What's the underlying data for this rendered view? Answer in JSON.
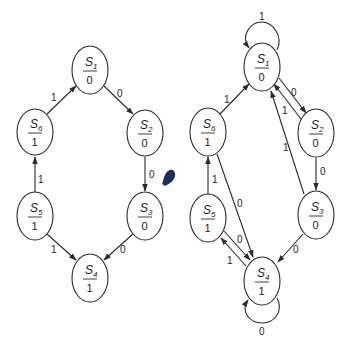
{
  "diagrams": [
    {
      "id": "left",
      "title": "Ring state machine",
      "states": [
        {
          "id": "S1",
          "name": "S",
          "sub": "1",
          "output": "0",
          "cx": 90,
          "cy": 70
        },
        {
          "id": "S2",
          "name": "S",
          "sub": "2",
          "output": "0",
          "cx": 145,
          "cy": 133
        },
        {
          "id": "S3",
          "name": "S",
          "sub": "3",
          "output": "0",
          "cx": 145,
          "cy": 216
        },
        {
          "id": "S4",
          "name": "S",
          "sub": "4",
          "output": "1",
          "cx": 90,
          "cy": 278
        },
        {
          "id": "S5",
          "name": "S",
          "sub": "5",
          "output": "1",
          "cx": 35,
          "cy": 216
        },
        {
          "id": "S6",
          "name": "S",
          "sub": "6",
          "output": "1",
          "cx": 35,
          "cy": 132
        }
      ],
      "transitions": [
        {
          "from": "S1",
          "to": "S2",
          "label": "0"
        },
        {
          "from": "S2",
          "to": "S3",
          "label": "0"
        },
        {
          "from": "S3",
          "to": "S4",
          "label": "0"
        },
        {
          "from": "S5",
          "to": "S4",
          "label": "1"
        },
        {
          "from": "S5",
          "to": "S6",
          "label": "1"
        },
        {
          "from": "S6",
          "to": "S1",
          "label": "1"
        }
      ]
    },
    {
      "id": "right",
      "title": "Complete state machine",
      "states": [
        {
          "id": "S1",
          "name": "S",
          "sub": "1",
          "output": "0",
          "cx": 262,
          "cy": 67
        },
        {
          "id": "S2",
          "name": "S",
          "sub": "2",
          "output": "0",
          "cx": 316,
          "cy": 133
        },
        {
          "id": "S3",
          "name": "S",
          "sub": "3",
          "output": "0",
          "cx": 316,
          "cy": 215
        },
        {
          "id": "S4",
          "name": "S",
          "sub": "4",
          "output": "1",
          "cx": 262,
          "cy": 281
        },
        {
          "id": "S5",
          "name": "S",
          "sub": "5",
          "output": "1",
          "cx": 208,
          "cy": 218
        },
        {
          "id": "S6",
          "name": "S",
          "sub": "6",
          "output": "1",
          "cx": 208,
          "cy": 132
        }
      ],
      "transitions": [
        {
          "from": "S1",
          "to": "S1",
          "label": "1"
        },
        {
          "from": "S1",
          "to": "S2",
          "label": "0"
        },
        {
          "from": "S2",
          "to": "S1",
          "label": "1"
        },
        {
          "from": "S2",
          "to": "S3",
          "label": "0"
        },
        {
          "from": "S3",
          "to": "S1",
          "label": "1"
        },
        {
          "from": "S3",
          "to": "S4",
          "label": "0"
        },
        {
          "from": "S4",
          "to": "S4",
          "label": "0"
        },
        {
          "from": "S4",
          "to": "S5",
          "label": "1"
        },
        {
          "from": "S5",
          "to": "S4",
          "label": "0"
        },
        {
          "from": "S5",
          "to": "S6",
          "label": "1"
        },
        {
          "from": "S6",
          "to": "S1",
          "label": "1"
        },
        {
          "from": "S6",
          "to": "S4",
          "label": "0"
        }
      ]
    }
  ],
  "labels": {
    "L_S1": {
      "name": "S",
      "sub": "1",
      "out": "0"
    },
    "L_S2": {
      "name": "S",
      "sub": "2",
      "out": "0"
    },
    "L_S3": {
      "name": "S",
      "sub": "3",
      "out": "0"
    },
    "L_S4": {
      "name": "S",
      "sub": "4",
      "out": "1"
    },
    "L_S5": {
      "name": "S",
      "sub": "5",
      "out": "1"
    },
    "L_S6": {
      "name": "S",
      "sub": "6",
      "out": "1"
    },
    "R_S1": {
      "name": "S",
      "sub": "1",
      "out": "0"
    },
    "R_S2": {
      "name": "S",
      "sub": "2",
      "out": "0"
    },
    "R_S3": {
      "name": "S",
      "sub": "3",
      "out": "0"
    },
    "R_S4": {
      "name": "S",
      "sub": "4",
      "out": "1"
    },
    "R_S5": {
      "name": "S",
      "sub": "5",
      "out": "1"
    },
    "R_S6": {
      "name": "S",
      "sub": "6",
      "out": "1"
    }
  },
  "edge_labels": {
    "left": {
      "s1_s2": "0",
      "s2_s3": "0",
      "s3_s4": "0",
      "s5_s4": "1",
      "s5_s6": "1",
      "s6_s1": "1"
    },
    "right": {
      "s1_self": "1",
      "s1_s2": "0",
      "s2_s1": "1",
      "s2_s3": "0",
      "s3_s1": "1",
      "s3_s4": "0",
      "s4_self": "0",
      "s4_s5": "1",
      "s5_s4": "0",
      "s5_s6": "1",
      "s6_s1": "1",
      "s6_s4": "0"
    }
  },
  "colors": {
    "stroke": "#2a2a2a",
    "text": "#222222",
    "background": "#ffffff",
    "blot": "#1c2f5c"
  }
}
